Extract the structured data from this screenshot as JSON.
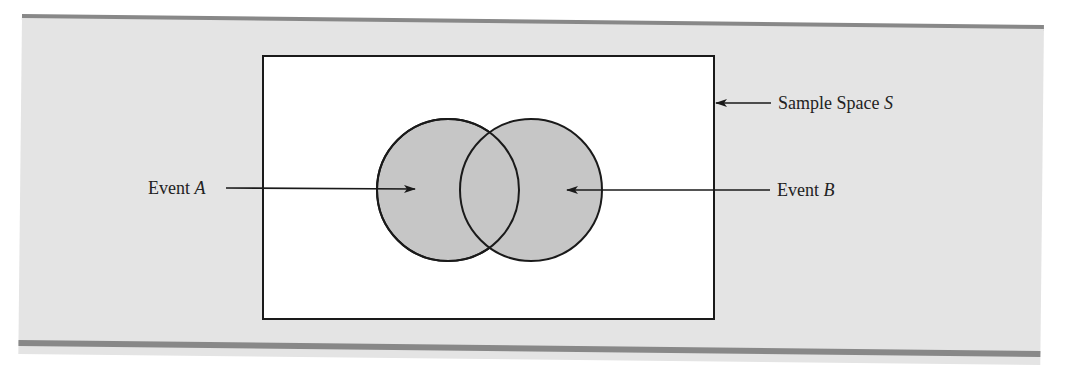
{
  "figure": {
    "sample_space_label": "Sample Space",
    "sample_space_symbol": "S",
    "event_a_label": "Event",
    "event_a_symbol": "A",
    "event_b_label": "Event",
    "event_b_symbol": "B"
  },
  "colors": {
    "panel_background": "#e4e4e4",
    "band": "#888888",
    "circle_fill": "#c6c6c6",
    "rectangle_fill": "#ffffff",
    "stroke": "#1a1a1a"
  }
}
